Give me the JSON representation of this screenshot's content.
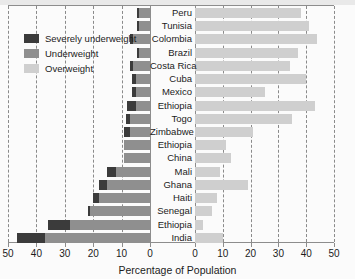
{
  "legend": {
    "items": [
      {
        "label": "Severely underweight",
        "color": "#3b3b3b",
        "key": "severely_underweight"
      },
      {
        "label": "Underweight",
        "color": "#8f8f8f",
        "key": "underweight"
      },
      {
        "label": "Overweight",
        "color": "#cfcfcf",
        "key": "overweight"
      }
    ]
  },
  "chart_data": {
    "type": "bar",
    "subtype": "diverging-stacked-horizontal",
    "title": "",
    "xlabel": "Percentage of Population",
    "ylabel": "",
    "grid": true,
    "legend_position": "top-left",
    "left_axis": {
      "ticks": [
        50,
        40,
        30,
        20,
        10,
        0
      ],
      "range": [
        50,
        0
      ],
      "direction": "reversed"
    },
    "right_axis": {
      "ticks": [
        0,
        10,
        20,
        30,
        40,
        50
      ],
      "range": [
        0,
        50
      ],
      "direction": "normal"
    },
    "series": [
      {
        "name": "Severely underweight",
        "color": "#3b3b3b",
        "side": "left"
      },
      {
        "name": "Underweight",
        "color": "#8f8f8f",
        "side": "left"
      },
      {
        "name": "Overweight",
        "color": "#cfcfcf",
        "side": "right"
      }
    ],
    "categories": [
      "Peru",
      "Tunisia",
      "Colombia",
      "Brazil",
      "Costa Rica",
      "Cuba",
      "Mexico",
      "Ethiopia",
      "Togo",
      "Zimbabwe",
      "Ethiopia",
      "China",
      "Mali",
      "Ghana",
      "Haiti",
      "Senegal",
      "Ethiopia",
      "India"
    ],
    "rows": [
      {
        "country": "Peru",
        "severely_underweight": 0.5,
        "underweight": 4,
        "overweight": 38
      },
      {
        "country": "Tunisia",
        "severely_underweight": 0.5,
        "underweight": 4,
        "overweight": 41
      },
      {
        "country": "Colombia",
        "severely_underweight": 1,
        "underweight": 6,
        "overweight": 44
      },
      {
        "country": "Brazil",
        "severely_underweight": 0.5,
        "underweight": 4,
        "overweight": 37
      },
      {
        "country": "Costa Rica",
        "severely_underweight": 1,
        "underweight": 6,
        "overweight": 34
      },
      {
        "country": "Cuba",
        "severely_underweight": 1.5,
        "underweight": 5,
        "overweight": 40
      },
      {
        "country": "Mexico",
        "severely_underweight": 1.5,
        "underweight": 5,
        "overweight": 25
      },
      {
        "country": "Ethiopia",
        "severely_underweight": 3,
        "underweight": 5,
        "overweight": 43
      },
      {
        "country": "Togo",
        "severely_underweight": 1.5,
        "underweight": 7,
        "overweight": 35
      },
      {
        "country": "Zimbabwe",
        "severely_underweight": 2,
        "underweight": 7,
        "overweight": 21
      },
      {
        "country": "Ethiopia",
        "severely_underweight": 0,
        "underweight": 9,
        "overweight": 11
      },
      {
        "country": "China",
        "severely_underweight": 0,
        "underweight": 9,
        "overweight": 13
      },
      {
        "country": "Mali",
        "severely_underweight": 3,
        "underweight": 12,
        "overweight": 9
      },
      {
        "country": "Ghana",
        "severely_underweight": 3,
        "underweight": 15,
        "overweight": 19
      },
      {
        "country": "Haiti",
        "severely_underweight": 2,
        "underweight": 18,
        "overweight": 8
      },
      {
        "country": "Senegal",
        "severely_underweight": 1,
        "underweight": 21,
        "overweight": 6
      },
      {
        "country": "Ethiopia",
        "severely_underweight": 8,
        "underweight": 28,
        "overweight": 3
      },
      {
        "country": "India",
        "severely_underweight": 10,
        "underweight": 37,
        "overweight": 10
      }
    ]
  }
}
